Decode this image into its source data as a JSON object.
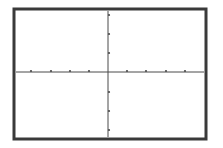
{
  "chart_data": {
    "type": "line",
    "title": "",
    "xlabel": "",
    "ylabel": "",
    "series": [],
    "x_ticks": [
      -4,
      -3,
      -2,
      -1,
      1,
      2,
      3,
      4
    ],
    "y_ticks": [
      -3,
      -2,
      -1,
      1,
      2,
      3
    ],
    "xlim": [
      -4.6,
      4.5
    ],
    "ylim": [
      -3.2,
      3.2
    ],
    "grid": false,
    "legend": null,
    "tick_labels_visible": false
  },
  "colors": {
    "frame": "#3a3a3a",
    "axes": "#4a4a4a",
    "background": "#ffffff"
  },
  "layout": {
    "frame": {
      "x": 14,
      "y": 9,
      "w": 192,
      "h": 130,
      "stroke": 3
    },
    "origin": {
      "x": 108,
      "y": 72
    },
    "x_tick_px": [
      31,
      51,
      70,
      89,
      127,
      146,
      166,
      185
    ],
    "y_tick_px": [
      15,
      34,
      53,
      92,
      111,
      130
    ]
  }
}
